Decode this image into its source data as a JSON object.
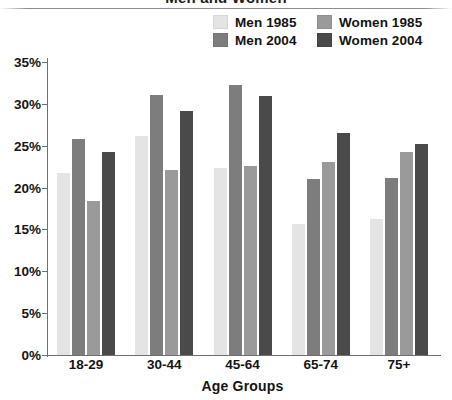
{
  "title": "Men and Women",
  "legend": [
    {
      "label": "Men 1985",
      "color": "#e4e4e4",
      "key": "men1985"
    },
    {
      "label": "Women 1985",
      "color": "#9a9a9a",
      "key": "women1985"
    },
    {
      "label": "Men 2004",
      "color": "#7d7d7d",
      "key": "men2004"
    },
    {
      "label": "Women 2004",
      "color": "#4a4a4a",
      "key": "women2004"
    }
  ],
  "y_axis": {
    "ticks": [
      "35%",
      "30%",
      "25%",
      "20%",
      "15%",
      "10%",
      "5%",
      "0%"
    ],
    "min": 0,
    "max": 35,
    "step": 5
  },
  "x_axis": {
    "title": "Age Groups",
    "categories": [
      "18-29",
      "30-44",
      "45-64",
      "65-74",
      "75+"
    ]
  },
  "chart_data": {
    "type": "bar",
    "title": "Men and Women",
    "xlabel": "Age Groups",
    "ylabel": "",
    "ylim": [
      0,
      35
    ],
    "ytick_labels": [
      "0%",
      "5%",
      "10%",
      "15%",
      "20%",
      "25%",
      "30%",
      "35%"
    ],
    "grid": false,
    "legend_position": "top-right",
    "categories": [
      "18-29",
      "30-44",
      "45-64",
      "65-74",
      "75+"
    ],
    "series": [
      {
        "name": "Men 1985",
        "color": "#e4e4e4",
        "values": [
          21.7,
          26.2,
          22.3,
          15.7,
          16.2
        ]
      },
      {
        "name": "Men 2004",
        "color": "#7d7d7d",
        "values": [
          25.8,
          31.1,
          32.2,
          21.0,
          21.1
        ]
      },
      {
        "name": "Women 1985",
        "color": "#9a9a9a",
        "values": [
          18.4,
          22.1,
          22.6,
          23.0,
          24.2
        ]
      },
      {
        "name": "Women 2004",
        "color": "#4a4a4a",
        "values": [
          24.2,
          29.2,
          31.0,
          26.5,
          25.2
        ]
      }
    ],
    "series_draw_order": [
      "Men 1985",
      "Men 2004",
      "Women 1985",
      "Women 2004"
    ]
  }
}
